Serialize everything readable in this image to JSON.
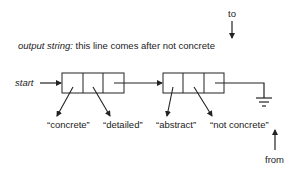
{
  "top_label": "to",
  "output": {
    "prefix": "output string:",
    "text": " this line comes after not concrete"
  },
  "start_label": "start",
  "nodes": [
    {
      "cells": 3
    },
    {
      "cells": 3
    }
  ],
  "strings": [
    "“concrete”",
    "“detailed”",
    "“abstract”",
    "“not concrete”"
  ],
  "bottom_label": "from",
  "terminator": "ground-icon",
  "colors": {
    "ink": "#222222",
    "background": "#ffffff"
  }
}
